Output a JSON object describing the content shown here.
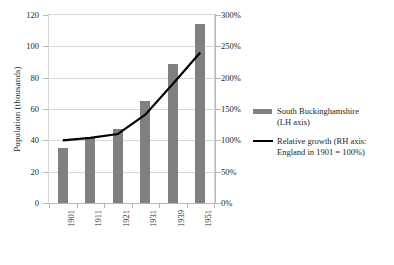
{
  "chart_data": {
    "type": "bar",
    "title": "",
    "subtitle": "",
    "categories": [
      "1901",
      "1911",
      "1921",
      "1931",
      "1939",
      "1951"
    ],
    "series": [
      {
        "name": "South Buckinghamshire (LH axis)",
        "type": "bar",
        "axis": "left",
        "color": "#808080",
        "values": [
          35,
          42,
          47,
          65,
          89,
          114
        ]
      },
      {
        "name": "Relative growth (RH axis: England in 1901 = 100%)",
        "type": "line",
        "axis": "right",
        "color": "#000000",
        "values": [
          100,
          104,
          110,
          141,
          190,
          240
        ]
      }
    ],
    "xlabel": "",
    "ylabel": "Population (thousands)",
    "y2label": "",
    "ylim": [
      0,
      120
    ],
    "y2lim": [
      0,
      300
    ],
    "yticks": [
      0,
      20,
      40,
      60,
      80,
      100,
      120
    ],
    "y2ticks": [
      0,
      50,
      100,
      150,
      200,
      250,
      300
    ],
    "ytick_labels": [
      "0",
      "20",
      "40",
      "60",
      "80",
      "100",
      "120"
    ],
    "y2tick_labels": [
      "0%",
      "50%",
      "100%",
      "150%",
      "200%",
      "250%",
      "300%"
    ],
    "grid": true,
    "legend_position": "right"
  },
  "axes": {
    "y_title": "Population (thousands)"
  },
  "legend": {
    "entries": [
      {
        "line1": "South Buckinghamshire",
        "line2": "(LH axis)",
        "marker": "bar-swatch"
      },
      {
        "line1": "Relative growth (RH axis:",
        "line2": "England in 1901 = 100%)",
        "marker": "line-swatch"
      }
    ]
  }
}
